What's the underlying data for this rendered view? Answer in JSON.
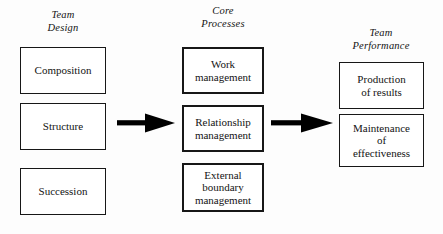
{
  "diagram": {
    "columns": [
      {
        "id": "team-design",
        "header": "Team\nDesign",
        "boxes": [
          {
            "id": "composition",
            "label": "Composition"
          },
          {
            "id": "structure",
            "label": "Structure"
          },
          {
            "id": "succession",
            "label": "Succession"
          }
        ]
      },
      {
        "id": "core-processes",
        "header": "Core\nProcesses",
        "boxes": [
          {
            "id": "work-management",
            "label": "Work\nmanagement"
          },
          {
            "id": "relationship-management",
            "label": "Relationship\nmanagement"
          },
          {
            "id": "external-boundary",
            "label": "External\nboundary\nmanagement"
          }
        ]
      },
      {
        "id": "team-performance",
        "header": "Team\nPerformance",
        "boxes": [
          {
            "id": "production-of-results",
            "label": "Production\nof results"
          },
          {
            "id": "maintenance-of-effectiveness",
            "label": "Maintenance\nof\neffectiveness"
          }
        ]
      }
    ],
    "arrows": [
      {
        "id": "design-to-process",
        "icon": "right-arrow-icon"
      },
      {
        "id": "process-to-perf",
        "icon": "right-arrow-icon"
      }
    ],
    "colors": {
      "background": "#fdfdfd",
      "box_fill": "#ffffff",
      "stroke": "#171717",
      "text": "#131313",
      "arrow": "#000000"
    }
  }
}
